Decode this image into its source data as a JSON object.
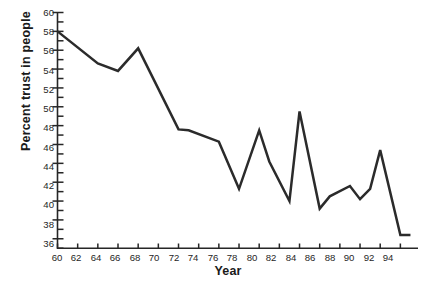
{
  "chart_data": {
    "type": "line",
    "title": "",
    "xlabel": "Year",
    "ylabel": "Percent trust in people",
    "xlim": [
      59.2,
      95.5
    ],
    "ylim": [
      34.6,
      60.0
    ],
    "grid": false,
    "legend": null,
    "y_major_ticks": [
      60,
      58,
      56,
      54,
      52,
      50,
      48,
      46,
      44,
      42,
      40,
      38,
      36
    ],
    "y_minor_ticks": [
      59,
      57,
      55,
      53,
      51,
      49,
      47,
      45,
      43,
      41,
      39,
      37,
      35
    ],
    "x_major_ticks": [
      60,
      62,
      64,
      66,
      68,
      70,
      72,
      74,
      76,
      78,
      80,
      82,
      84,
      86,
      88,
      90,
      92,
      94
    ],
    "x": [
      60,
      64,
      66,
      68,
      72,
      73,
      76,
      78,
      80,
      81,
      83,
      84,
      86,
      87,
      89,
      90,
      91,
      92,
      94,
      95
    ],
    "values": [
      58.0,
      54.6,
      53.8,
      56.2,
      47.6,
      47.5,
      46.3,
      41.3,
      47.5,
      44.2,
      40.0,
      49.5,
      39.2,
      40.5,
      41.6,
      40.2,
      41.3,
      45.4,
      36.4,
      36.4
    ],
    "series": [
      {
        "name": "Percent trust in people",
        "color": "#2b2b2b",
        "points": [
          {
            "x": 60,
            "y": 58.0
          },
          {
            "x": 64,
            "y": 54.6
          },
          {
            "x": 66,
            "y": 53.8
          },
          {
            "x": 68,
            "y": 56.2
          },
          {
            "x": 72,
            "y": 47.6
          },
          {
            "x": 73,
            "y": 47.5
          },
          {
            "x": 76,
            "y": 46.3
          },
          {
            "x": 78,
            "y": 41.3
          },
          {
            "x": 80,
            "y": 47.5
          },
          {
            "x": 81,
            "y": 44.2
          },
          {
            "x": 83,
            "y": 40.0
          },
          {
            "x": 84,
            "y": 49.5
          },
          {
            "x": 86,
            "y": 39.2
          },
          {
            "x": 87,
            "y": 40.5
          },
          {
            "x": 89,
            "y": 41.6
          },
          {
            "x": 90,
            "y": 40.2
          },
          {
            "x": 91,
            "y": 41.3
          },
          {
            "x": 92,
            "y": 45.4
          },
          {
            "x": 94,
            "y": 36.4
          },
          {
            "x": 95,
            "y": 36.4
          }
        ]
      }
    ],
    "axis_color": "#262626",
    "line_color": "#2b2b2b",
    "background": "#ffffff"
  },
  "axes": {
    "y_title": "Percent trust in people",
    "x_title": "Year",
    "y_labels": [
      "60",
      "58",
      "56",
      "54",
      "52",
      "50",
      "48",
      "46",
      "44",
      "42",
      "40",
      "38",
      "36"
    ],
    "x_labels": [
      "60",
      "62",
      "64",
      "66",
      "68",
      "70",
      "72",
      "74",
      "76",
      "78",
      "80",
      "82",
      "84",
      "86",
      "88",
      "90",
      "92",
      "94"
    ]
  }
}
